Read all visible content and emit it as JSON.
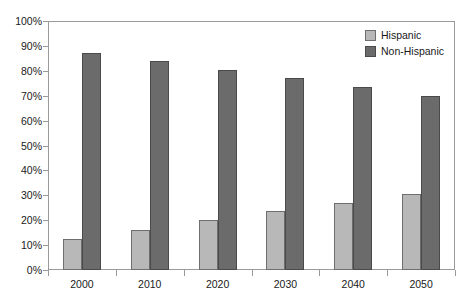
{
  "chart_data": {
    "type": "bar",
    "title": "",
    "subtitle": "",
    "xlabel": "",
    "ylabel": "",
    "categories": [
      "2000",
      "2010",
      "2020",
      "2030",
      "2040",
      "2050"
    ],
    "series": [
      {
        "name": "Hispanic",
        "color": "#b8b8b8",
        "values": [
          12.5,
          16,
          20,
          23.5,
          27,
          30.5
        ]
      },
      {
        "name": "Non-Hispanic",
        "color": "#6b6b6b",
        "values": [
          87,
          84,
          80.5,
          77,
          73.5,
          70
        ]
      }
    ],
    "ylim": [
      0,
      100
    ],
    "ytick_values": [
      0,
      10,
      20,
      30,
      40,
      50,
      60,
      70,
      80,
      90,
      100
    ],
    "ytick_labels": [
      "0%",
      "10%",
      "20%",
      "30%",
      "40%",
      "50%",
      "60%",
      "70%",
      "80%",
      "90%",
      "100%"
    ],
    "grid": false,
    "legend_position": "top-right",
    "legend": [
      "Hispanic",
      "Non-Hispanic"
    ]
  },
  "axes": {
    "y_labels": [
      "100%",
      "90%",
      "80%",
      "70%",
      "60%",
      "50%",
      "40%",
      "30%",
      "20%",
      "10%",
      "0%"
    ],
    "x_labels": [
      "2000",
      "2010",
      "2020",
      "2030",
      "2040",
      "2050"
    ]
  },
  "legend": {
    "items": [
      {
        "label": "Hispanic",
        "swatch": "light-gray-swatch-icon"
      },
      {
        "label": "Non-Hispanic",
        "swatch": "dark-gray-swatch-icon"
      }
    ]
  }
}
